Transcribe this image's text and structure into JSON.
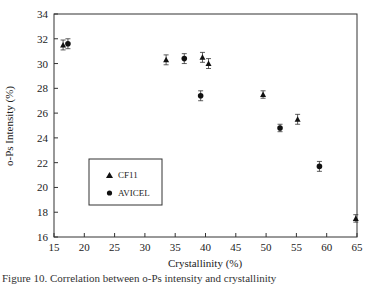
{
  "chart_data": {
    "type": "scatter",
    "title": "",
    "xlabel": "Crystallinity (%)",
    "ylabel": "o-Ps Intensity (%)",
    "xlim": [
      15,
      65
    ],
    "ylim": [
      16,
      34
    ],
    "xticks": [
      15,
      20,
      25,
      30,
      35,
      40,
      45,
      50,
      55,
      60,
      65
    ],
    "yticks": [
      16,
      18,
      20,
      22,
      24,
      26,
      28,
      30,
      32,
      34
    ],
    "grid": false,
    "legend_position": "lower-left inside",
    "error_bars": true,
    "series": [
      {
        "name": "CF11",
        "marker": "triangle",
        "points": [
          {
            "x": 16.5,
            "y": 31.5,
            "err": 0.4
          },
          {
            "x": 33.5,
            "y": 30.3,
            "err": 0.4
          },
          {
            "x": 39.5,
            "y": 30.5,
            "err": 0.4
          },
          {
            "x": 40.5,
            "y": 30.0,
            "err": 0.4
          },
          {
            "x": 49.5,
            "y": 27.5,
            "err": 0.3
          },
          {
            "x": 55.2,
            "y": 25.5,
            "err": 0.4
          },
          {
            "x": 64.8,
            "y": 17.5,
            "err": 0.3
          }
        ]
      },
      {
        "name": "AVICEL",
        "marker": "circle",
        "points": [
          {
            "x": 17.3,
            "y": 31.6,
            "err": 0.4
          },
          {
            "x": 36.5,
            "y": 30.4,
            "err": 0.4
          },
          {
            "x": 39.2,
            "y": 27.4,
            "err": 0.4
          },
          {
            "x": 52.3,
            "y": 24.8,
            "err": 0.3
          },
          {
            "x": 58.8,
            "y": 21.7,
            "err": 0.4
          }
        ]
      }
    ]
  },
  "legend": {
    "items": [
      {
        "label": "CF11",
        "marker": "triangle"
      },
      {
        "label": "AVICEL",
        "marker": "circle"
      }
    ]
  },
  "caption": "Figure 10. Correlation between o-Ps intensity and crystallinity"
}
